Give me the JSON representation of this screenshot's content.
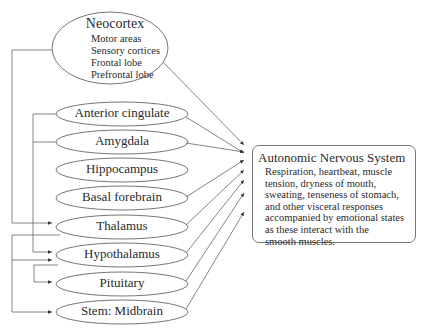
{
  "diagram": {
    "nodes": [
      {
        "id": "neocortex",
        "label": "Neocortex",
        "items": [
          "Motor areas",
          "Sensory cortices",
          "Frontal lobe",
          "Prefrontal lobe"
        ]
      },
      {
        "id": "anterior-cingulate",
        "label": "Anterior cingulate"
      },
      {
        "id": "amygdala",
        "label": "Amygdala"
      },
      {
        "id": "hippocampus",
        "label": "Hippocampus"
      },
      {
        "id": "basal-forebrain",
        "label": "Basal forebrain"
      },
      {
        "id": "thalamus",
        "label": "Thalamus"
      },
      {
        "id": "hypothalamus",
        "label": "Hypothalamus"
      },
      {
        "id": "pituitary",
        "label": "Pituitary"
      },
      {
        "id": "stem-midbrain",
        "label": "Stem: Midbrain"
      }
    ],
    "target": {
      "title": "Autonomic Nervous System",
      "lines": [
        "Respiration, heartbeat, muscle",
        "tension, dryness of mouth,",
        "sweating, tenseness of stomach,",
        "and other visceral responses",
        "accompanied by emotional states",
        "as these interact with the",
        "smooth muscles."
      ]
    }
  }
}
